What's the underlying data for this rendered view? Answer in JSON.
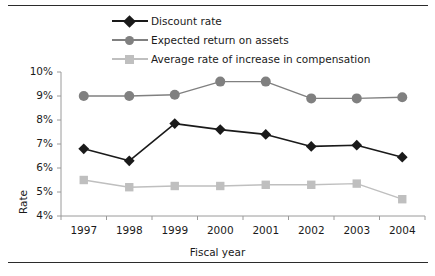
{
  "chart_data": {
    "type": "line",
    "title": "",
    "xlabel": "Fiscal year",
    "ylabel": "Rate",
    "categories": [
      "1997",
      "1998",
      "1999",
      "2000",
      "2001",
      "2002",
      "2003",
      "2004"
    ],
    "ylim": [
      4,
      10
    ],
    "yticks": [
      "4%",
      "5%",
      "6%",
      "7%",
      "8%",
      "9%",
      "10%"
    ],
    "ytick_values": [
      4,
      5,
      6,
      7,
      8,
      9,
      10
    ],
    "grid": false,
    "legend_position": "top",
    "series": [
      {
        "name": "Discount rate",
        "marker": "diamond",
        "color": "#1a1a1a",
        "values": [
          6.8,
          6.3,
          7.85,
          7.6,
          7.4,
          6.9,
          6.95,
          6.45
        ]
      },
      {
        "name": "Expected return on assets",
        "marker": "circle",
        "color": "#808080",
        "values": [
          9.0,
          9.0,
          9.05,
          9.6,
          9.6,
          8.9,
          8.9,
          8.95
        ]
      },
      {
        "name": "Average rate of increase in compensation",
        "marker": "square",
        "color": "#bfbfbf",
        "values": [
          5.5,
          5.2,
          5.25,
          5.25,
          5.3,
          5.3,
          5.35,
          4.7
        ]
      }
    ]
  },
  "axis": {
    "line_color": "#9a9a9a",
    "frame_rule_color": "#2b2b2b"
  }
}
